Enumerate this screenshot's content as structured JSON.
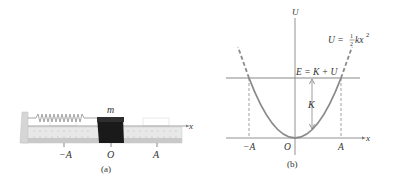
{
  "panel_a": {
    "caption": "(a)",
    "mass_label": "m",
    "axis_label": "x",
    "ticks": [
      {
        "label": "−A",
        "x": 64
      },
      {
        "label": "O",
        "x": 111
      },
      {
        "label": "A",
        "x": 157
      }
    ],
    "colors": {
      "track": "#e6e6e6",
      "track_dark": "#c8c8c8",
      "mass": "#1a1a1a",
      "spring": "#9a9a9a"
    }
  },
  "panel_b": {
    "caption": "(b)",
    "y_axis_label": "U",
    "x_axis_label": "x",
    "curve_label": "U = ½kx²",
    "curve_label_prefix": "U = ",
    "curve_label_frac_num": "1",
    "curve_label_frac_den": "2",
    "curve_label_suffix": "kx",
    "curve_label_exp": "2",
    "energy_label": "E = K + U",
    "k_label": "K",
    "ticks": [
      {
        "label": "−A"
      },
      {
        "label": "O"
      },
      {
        "label": "A"
      }
    ],
    "colors": {
      "curve": "#8a8a8a",
      "axis": "#777777",
      "energy_line": "#888888"
    }
  }
}
